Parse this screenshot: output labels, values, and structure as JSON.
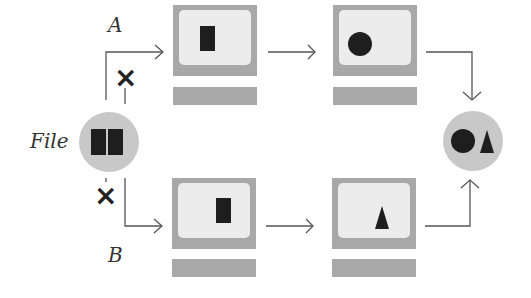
{
  "labels": {
    "file": "File",
    "path_a": "A",
    "path_b": "B"
  },
  "colors": {
    "monitor_frame": "#a8a8a8",
    "screen": "#ececec",
    "circle": "#c8c8c8",
    "shape": "#1e1e1e",
    "line": "#555555"
  },
  "nodes": {
    "source": {
      "label": "File",
      "content": [
        "rectangle",
        "rectangle"
      ]
    },
    "path_a": [
      {
        "content": "rectangle"
      },
      {
        "content": "circle"
      }
    ],
    "path_b": [
      {
        "content": "rectangle"
      },
      {
        "content": "triangle"
      }
    ],
    "result": {
      "content": [
        "circle",
        "triangle"
      ]
    }
  },
  "marks": {
    "blocked_a": "×",
    "blocked_b": "×"
  }
}
